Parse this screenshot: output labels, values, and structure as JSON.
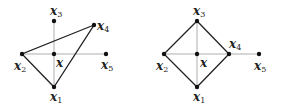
{
  "diagrams": [
    {
      "name": "triangle-config",
      "points": {
        "x1": {
          "label": "x",
          "sub": "1",
          "cx": 54,
          "cy": 87
        },
        "x2": {
          "label": "x",
          "sub": "2",
          "cx": 22,
          "cy": 54
        },
        "x3": {
          "label": "x",
          "sub": "3",
          "cx": 54,
          "cy": 21
        },
        "x4": {
          "label": "x",
          "sub": "4",
          "cx": 94,
          "cy": 25
        },
        "x5": {
          "label": "x",
          "sub": "5",
          "cx": 106,
          "cy": 54
        },
        "center": {
          "label": "x",
          "sub": "",
          "cx": 54,
          "cy": 54
        }
      },
      "polygon": [
        "x1",
        "x2",
        "x4"
      ]
    },
    {
      "name": "diamond-config",
      "points": {
        "x1": {
          "label": "x",
          "sub": "1",
          "cx": 197,
          "cy": 87
        },
        "x2": {
          "label": "x",
          "sub": "2",
          "cx": 164,
          "cy": 54
        },
        "x3": {
          "label": "x",
          "sub": "3",
          "cx": 197,
          "cy": 21
        },
        "x4": {
          "label": "x",
          "sub": "4",
          "cx": 229,
          "cy": 54
        },
        "x5": {
          "label": "x",
          "sub": "5",
          "cx": 259,
          "cy": 54
        },
        "center": {
          "label": "x",
          "sub": "",
          "cx": 197,
          "cy": 54
        }
      },
      "polygon": [
        "x1",
        "x2",
        "x3",
        "x4"
      ]
    }
  ]
}
